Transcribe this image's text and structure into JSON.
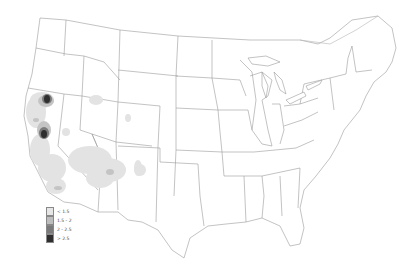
{
  "map": {
    "title": "",
    "region": "Contiguous United States",
    "legend": [
      {
        "label": "< 1.5",
        "color": "#e6e6e6"
      },
      {
        "label": "1.5 - 2",
        "color": "#bdbdbd"
      },
      {
        "label": "2 - 2.5",
        "color": "#7a7a7a"
      },
      {
        "label": "> 2.5",
        "color": "#2e2e2e"
      }
    ],
    "hotspots": [
      {
        "name": "northern-california-north",
        "level": 3
      },
      {
        "name": "northern-california-central",
        "level": 3
      },
      {
        "name": "california-coast",
        "level": 0
      },
      {
        "name": "california-central-valley",
        "level": 0
      },
      {
        "name": "arizona",
        "level": 0
      },
      {
        "name": "new-mexico",
        "level": 0
      },
      {
        "name": "southern-idaho",
        "level": 0
      },
      {
        "name": "northeastern-nevada",
        "level": 0
      }
    ]
  }
}
